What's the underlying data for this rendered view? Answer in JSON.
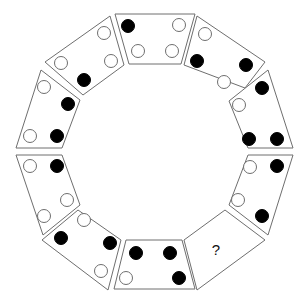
{
  "diagram": {
    "title": "",
    "layout": "decagon ring of 10 trapezoid panels, each with 4 dots (black or white) or a question mark",
    "colors": {
      "black_dot": "#000000",
      "white_dot": "#ffffff",
      "outline": "#6e6e6e"
    },
    "panels": [
      {
        "id": "top",
        "points": "115,14 195,14 181,64 129,64",
        "dots": [
          {
            "x": 128,
            "y": 26,
            "color": "black"
          },
          {
            "x": 179,
            "y": 25,
            "color": "white"
          },
          {
            "x": 138,
            "y": 51,
            "color": "white"
          },
          {
            "x": 172,
            "y": 51,
            "color": "white"
          }
        ]
      },
      {
        "id": "top-right",
        "points": "197,16 265,62 245,88 184,65",
        "dots": [
          {
            "x": 205,
            "y": 34,
            "color": "white"
          },
          {
            "x": 197,
            "y": 61,
            "color": "black"
          },
          {
            "x": 246,
            "y": 65,
            "color": "black"
          },
          {
            "x": 224,
            "y": 82,
            "color": "white"
          }
        ]
      },
      {
        "id": "right-upper",
        "points": "268,70 293,148 248,148 229,101",
        "dots": [
          {
            "x": 262,
            "y": 88,
            "color": "black"
          },
          {
            "x": 239,
            "y": 105,
            "color": "white"
          },
          {
            "x": 249,
            "y": 139,
            "color": "black"
          },
          {
            "x": 277,
            "y": 139,
            "color": "black"
          }
        ]
      },
      {
        "id": "right-lower",
        "points": "248,155 293,155 268,235 229,205",
        "dots": [
          {
            "x": 250,
            "y": 167,
            "color": "white"
          },
          {
            "x": 277,
            "y": 166,
            "color": "black"
          },
          {
            "x": 238,
            "y": 200,
            "color": "white"
          },
          {
            "x": 262,
            "y": 216,
            "color": "black"
          }
        ]
      },
      {
        "id": "bottom-right",
        "points": "225,210 265,240 197,290 184,240",
        "question": "?",
        "qx": 216,
        "qy": 255,
        "dots": []
      },
      {
        "id": "bottom",
        "points": "126,240 182,240 195,289 114,289",
        "dots": [
          {
            "x": 136,
            "y": 253,
            "color": "black"
          },
          {
            "x": 170,
            "y": 253,
            "color": "black"
          },
          {
            "x": 126,
            "y": 278,
            "color": "white"
          },
          {
            "x": 179,
            "y": 278,
            "color": "black"
          }
        ]
      },
      {
        "id": "bottom-left",
        "points": "78,210 121,240 108,290 42,240",
        "dots": [
          {
            "x": 84,
            "y": 220,
            "color": "white"
          },
          {
            "x": 61,
            "y": 238,
            "color": "black"
          },
          {
            "x": 110,
            "y": 243,
            "color": "black"
          },
          {
            "x": 101,
            "y": 271,
            "color": "white"
          }
        ]
      },
      {
        "id": "left-lower",
        "points": "16,155 62,155 80,205 43,235",
        "dots": [
          {
            "x": 30,
            "y": 166,
            "color": "white"
          },
          {
            "x": 57,
            "y": 166,
            "color": "black"
          },
          {
            "x": 67,
            "y": 200,
            "color": "white"
          },
          {
            "x": 44,
            "y": 216,
            "color": "white"
          }
        ]
      },
      {
        "id": "left-upper",
        "points": "41,70 80,100 62,148 16,148",
        "dots": [
          {
            "x": 44,
            "y": 87,
            "color": "white"
          },
          {
            "x": 68,
            "y": 104,
            "color": "black"
          },
          {
            "x": 30,
            "y": 136,
            "color": "white"
          },
          {
            "x": 57,
            "y": 136,
            "color": "black"
          }
        ]
      },
      {
        "id": "top-left",
        "points": "110,16 124,65 83,95 45,62",
        "dots": [
          {
            "x": 104,
            "y": 33,
            "color": "white"
          },
          {
            "x": 61,
            "y": 63,
            "color": "white"
          },
          {
            "x": 111,
            "y": 61,
            "color": "white"
          },
          {
            "x": 84,
            "y": 80,
            "color": "black"
          }
        ]
      }
    ],
    "dot_radius": 6.5
  }
}
